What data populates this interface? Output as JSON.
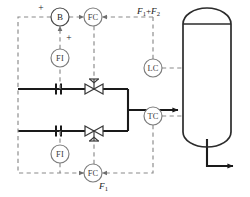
{
  "diagram": {
    "type": "process-and-instrumentation-diagram",
    "colors": {
      "pipe": "#1a1a1a",
      "signal": "#8a8a8a",
      "vessel": "#2b2b2b",
      "bubble_fill": "#ffffff",
      "background": "#ffffff"
    }
  },
  "instruments": [
    {
      "id": "summer",
      "tag": "B",
      "name": "summing-block",
      "x": 60,
      "y": 17
    },
    {
      "id": "fc_top",
      "tag": "FC",
      "name": "flow-controller-top",
      "x": 93,
      "y": 17
    },
    {
      "id": "fi_top",
      "tag": "FI",
      "name": "flow-indicator-top",
      "x": 60,
      "y": 58
    },
    {
      "id": "fi_bottom",
      "tag": "FI",
      "name": "flow-indicator-bottom",
      "x": 60,
      "y": 136
    },
    {
      "id": "fc_bottom",
      "tag": "FC",
      "name": "flow-controller-bottom",
      "x": 93,
      "y": 173
    },
    {
      "id": "lc",
      "tag": "LC",
      "name": "level-controller",
      "x": 153,
      "y": 68
    },
    {
      "id": "tc",
      "tag": "TC",
      "name": "temperature-controller",
      "x": 153,
      "y": 116
    }
  ],
  "signs": [
    {
      "id": "sign_summer_in",
      "label": "+",
      "x": 41,
      "y": 8
    },
    {
      "id": "sign_summer_fi",
      "label": "+",
      "x": 69,
      "y": 38
    }
  ],
  "stream_labels": {
    "total_flow": {
      "base": "F",
      "sub1": "1",
      "op": "+",
      "base2": "F",
      "sub2": "2",
      "x": 137,
      "y": 11
    },
    "primary_flow": {
      "base": "F",
      "sub1": "1",
      "x": 99,
      "y": 186
    }
  },
  "valves": [
    {
      "id": "valve_top",
      "name": "control-valve-top",
      "x": 94,
      "y": 89
    },
    {
      "id": "valve_bottom",
      "name": "control-valve-bottom",
      "x": 94,
      "y": 131
    }
  ],
  "flow_elements": [
    {
      "id": "orifice_top",
      "name": "orifice-plate-top",
      "x": 60,
      "y": 89
    },
    {
      "id": "orifice_bottom",
      "name": "orifice-plate-bottom",
      "x": 60,
      "y": 131
    }
  ],
  "vessel": {
    "name": "distillation-column",
    "x": 183,
    "y": 18,
    "width": 48,
    "height": 114
  },
  "streams": [
    {
      "id": "feed_a",
      "name": "feed-inlet-upper"
    },
    {
      "id": "feed_b",
      "name": "feed-inlet-lower"
    },
    {
      "id": "combined_feed",
      "name": "combined-feed-to-column"
    },
    {
      "id": "bottoms",
      "name": "bottoms-outlet"
    }
  ]
}
